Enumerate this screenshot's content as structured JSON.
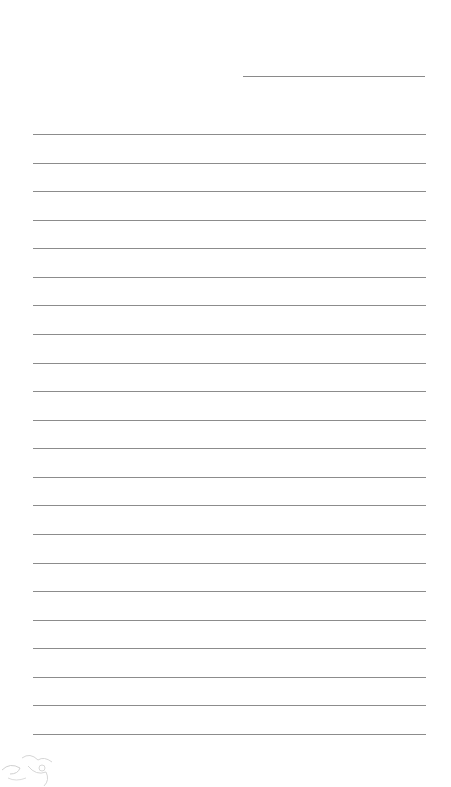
{
  "page": {
    "type": "lined-writing-paper",
    "background_color": "#ffffff",
    "line_color": "#8c8c8c",
    "header_ghost_text": "",
    "date_line": {
      "visible": true
    },
    "rule_lines": {
      "count": 22,
      "first_y": 134,
      "spacing": 28.57
    },
    "corner_illustration": {
      "icon": "sketch-doodle-icon",
      "position": "bottom-left"
    }
  }
}
